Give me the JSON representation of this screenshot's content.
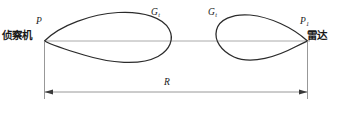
{
  "figure": {
    "type": "antenna-gain-lobe-diagram",
    "background_color": "#ffffff",
    "line_color": "#2b2b2b",
    "axis_color": "#9a9a9a"
  },
  "labels": {
    "aircraft_text": "侦察机",
    "radar_text": "雷达",
    "p_left_symbol": "P",
    "p_left_subscript": "",
    "p_right_symbol": "P",
    "p_right_subscript": "1",
    "gain_left_symbol": "G",
    "gain_left_subscript": "t",
    "gain_right_symbol": "G",
    "gain_right_subscript": "t",
    "range_symbol": "R"
  },
  "geometry": {
    "axis_y": 41,
    "axis_x_start": 44,
    "axis_x_end": 308,
    "dimension_y": 92,
    "dimension_x_start": 44,
    "dimension_x_end": 308,
    "left_lobe": {
      "apex_x": 44,
      "tip_x": 170,
      "max_half_height": 25
    },
    "right_lobe": {
      "apex_x": 308,
      "tip_x": 216,
      "max_half_height": 23
    }
  }
}
